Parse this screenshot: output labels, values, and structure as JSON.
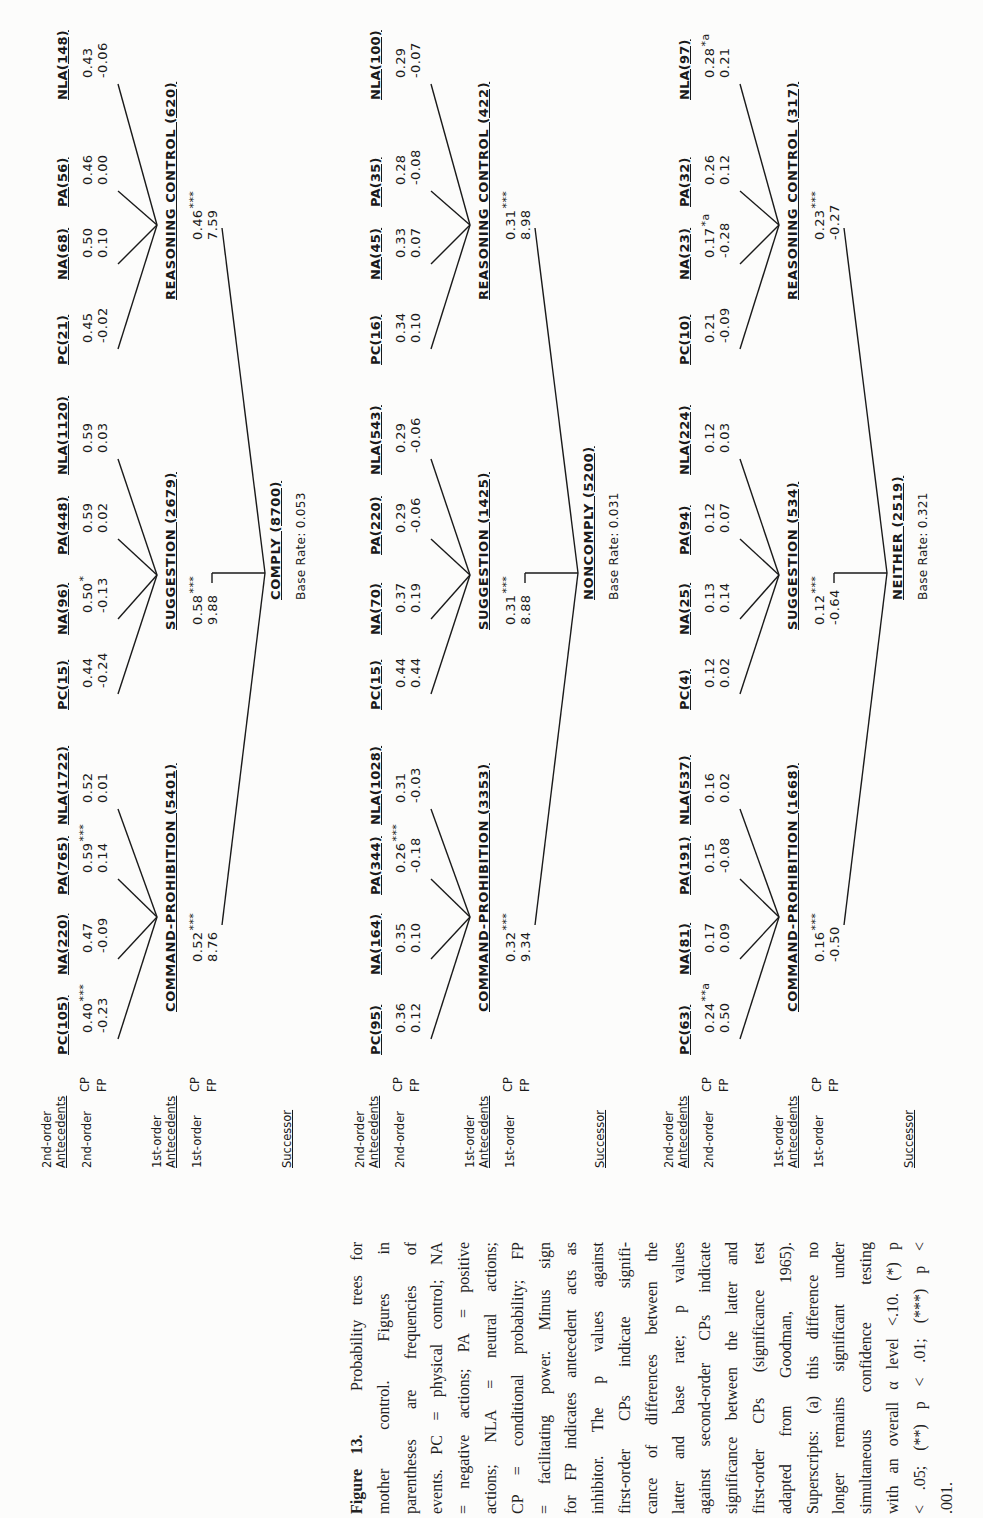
{
  "row_labels": {
    "second_order_header": [
      "2nd-order",
      "Antecedents"
    ],
    "second_order_row": "2nd-order",
    "first_order_header": [
      "1st-order",
      "Antecedents"
    ],
    "first_order_row": "1st-order",
    "successor": "Successor",
    "cp": "CP",
    "fp": "FP"
  },
  "trees": [
    {
      "successor": {
        "label": "COMPLY (8700)",
        "base_rate": "Base Rate: 0.053"
      },
      "first_order": [
        {
          "label": "COMMAND-PROHIBITION (5401)",
          "cp": "0.52",
          "cp_sup": "***",
          "fp": "8.76",
          "children": [
            {
              "label": "PC(105)",
              "cp": "0.40",
              "cp_sup": "***",
              "fp": "-0.23"
            },
            {
              "label": "NA(220)",
              "cp": "0.47",
              "cp_sup": "",
              "fp": "-0.09"
            },
            {
              "label": "PA(765)",
              "cp": "0.59",
              "cp_sup": "***",
              "fp": "0.14"
            },
            {
              "label": "NLA(1722)",
              "cp": "0.52",
              "cp_sup": "",
              "fp": "0.01"
            }
          ]
        },
        {
          "label": "SUGGESTION (2679)",
          "cp": "0.58",
          "cp_sup": "***",
          "fp": "9.88",
          "children": [
            {
              "label": "PC(15)",
              "cp": "0.44",
              "cp_sup": "",
              "fp": "-0.24"
            },
            {
              "label": "NA(96)",
              "cp": "0.50",
              "cp_sup": "*",
              "fp": "-0.13"
            },
            {
              "label": "PA(448)",
              "cp": "0.59",
              "cp_sup": "",
              "fp": "0.02"
            },
            {
              "label": "NLA(1120)",
              "cp": "0.59",
              "cp_sup": "",
              "fp": "0.03"
            }
          ]
        },
        {
          "label": "REASONING CONTROL (620)",
          "cp": "0.46",
          "cp_sup": "***",
          "fp": "7.59",
          "children": [
            {
              "label": "PC(21)",
              "cp": "0.45",
              "cp_sup": "",
              "fp": "-0.02"
            },
            {
              "label": "NA(68)",
              "cp": "0.50",
              "cp_sup": "",
              "fp": "0.10"
            },
            {
              "label": "PA(56)",
              "cp": "0.46",
              "cp_sup": "",
              "fp": "0.00"
            },
            {
              "label": "NLA(148)",
              "cp": "0.43",
              "cp_sup": "",
              "fp": "-0.06"
            }
          ]
        }
      ]
    },
    {
      "successor": {
        "label": "NONCOMPLY (5200)",
        "base_rate": "Base Rate: 0.031"
      },
      "first_order": [
        {
          "label": "COMMAND-PROHIBITION (3353)",
          "cp": "0.32",
          "cp_sup": "***",
          "fp": "9.34",
          "children": [
            {
              "label": "PC(95)",
              "cp": "0.36",
              "cp_sup": "",
              "fp": "0.12"
            },
            {
              "label": "NA(164)",
              "cp": "0.35",
              "cp_sup": "",
              "fp": "0.10"
            },
            {
              "label": "PA(344)",
              "cp": "0.26",
              "cp_sup": "***",
              "fp": "-0.18"
            },
            {
              "label": "NLA(1028)",
              "cp": "0.31",
              "cp_sup": "",
              "fp": "-0.03"
            }
          ]
        },
        {
          "label": "SUGGESTION (1425)",
          "cp": "0.31",
          "cp_sup": "***",
          "fp": "8.88",
          "children": [
            {
              "label": "PC(15)",
              "cp": "0.44",
              "cp_sup": "",
              "fp": "0.44"
            },
            {
              "label": "NA(70)",
              "cp": "0.37",
              "cp_sup": "",
              "fp": "0.19"
            },
            {
              "label": "PA(220)",
              "cp": "0.29",
              "cp_sup": "",
              "fp": "-0.06"
            },
            {
              "label": "NLA(543)",
              "cp": "0.29",
              "cp_sup": "",
              "fp": "-0.06"
            }
          ]
        },
        {
          "label": "REASONING CONTROL (422)",
          "cp": "0.31",
          "cp_sup": "***",
          "fp": "8.98",
          "children": [
            {
              "label": "PC(16)",
              "cp": "0.34",
              "cp_sup": "",
              "fp": "0.10"
            },
            {
              "label": "NA(45)",
              "cp": "0.33",
              "cp_sup": "",
              "fp": "0.07"
            },
            {
              "label": "PA(35)",
              "cp": "0.28",
              "cp_sup": "",
              "fp": "-0.08"
            },
            {
              "label": "NLA(100)",
              "cp": "0.29",
              "cp_sup": "",
              "fp": "-0.07"
            }
          ]
        }
      ]
    },
    {
      "successor": {
        "label": "NEITHER (2519)",
        "base_rate": "Base Rate: 0.321"
      },
      "first_order": [
        {
          "label": "COMMAND-PROHIBITION (1668)",
          "cp": "0.16",
          "cp_sup": "***",
          "fp": "-0.50",
          "children": [
            {
              "label": "PC(63)",
              "cp": "0.24",
              "cp_sup": "**a",
              "fp": "0.50"
            },
            {
              "label": "NA(81)",
              "cp": "0.17",
              "cp_sup": "",
              "fp": "0.09"
            },
            {
              "label": "PA(191)",
              "cp": "0.15",
              "cp_sup": "",
              "fp": "-0.08"
            },
            {
              "label": "NLA(537)",
              "cp": "0.16",
              "cp_sup": "",
              "fp": "0.02"
            }
          ]
        },
        {
          "label": "SUGGESTION (534)",
          "cp": "0.12",
          "cp_sup": "***",
          "fp": "-0.64",
          "children": [
            {
              "label": "PC(4)",
              "cp": "0.12",
              "cp_sup": "",
              "fp": "0.02"
            },
            {
              "label": "NA(25)",
              "cp": "0.13",
              "cp_sup": "",
              "fp": "0.14"
            },
            {
              "label": "PA(94)",
              "cp": "0.12",
              "cp_sup": "",
              "fp": "0.07"
            },
            {
              "label": "NLA(224)",
              "cp": "0.12",
              "cp_sup": "",
              "fp": "0.03"
            }
          ]
        },
        {
          "label": "REASONING CONTROL (317)",
          "cp": "0.23",
          "cp_sup": "***",
          "fp": "-0.27",
          "children": [
            {
              "label": "PC(10)",
              "cp": "0.21",
              "cp_sup": "",
              "fp": "-0.09"
            },
            {
              "label": "NA(23)",
              "cp": "0.17",
              "cp_sup": "*a",
              "fp": "-0.28"
            },
            {
              "label": "PA(32)",
              "cp": "0.26",
              "cp_sup": "",
              "fp": "0.12"
            },
            {
              "label": "NLA(97)",
              "cp": "0.28",
              "cp_sup": "*a",
              "fp": "0.21"
            }
          ]
        }
      ]
    }
  ],
  "caption": {
    "title": "Figure 13.",
    "lines": [
      "Probability trees for",
      "mother control. Figures in",
      "parentheses are frequencies of",
      "events. PC = physical control; NA",
      "= negative actions; PA = positive",
      "actions; NLA = neutral actions;",
      "CP = conditional probability; FP",
      "= facilitating power. Minus sign",
      "for FP indicates antecedent acts as",
      "inhibitor. The p values against",
      "first-order CPs indicate signifi-",
      "cance of differences between the",
      "latter and base rate; p values",
      "against second-order CPs indicate",
      "significance between the latter and",
      "first-order CPs (significance test",
      "adapted from Goodman, 1965).",
      "Superscripts: (a) this difference no",
      "longer remains significant under",
      "simultaneous confidence testing",
      "with an overall α level <.10. (*) p",
      "< .05; (**) p < .01; (***) p <",
      ".001."
    ]
  }
}
